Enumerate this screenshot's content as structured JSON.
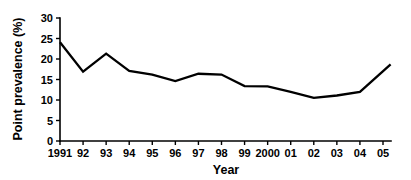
{
  "chart_data": {
    "type": "line",
    "title": "",
    "xlabel": "Year",
    "ylabel": "Point prevalence (%)",
    "categories": [
      "1991",
      "92",
      "93",
      "94",
      "95",
      "96",
      "97",
      "98",
      "99",
      "2000",
      "01",
      "02",
      "03",
      "04",
      "05"
    ],
    "x_tick_labels": [
      "1991",
      "92",
      "93",
      "94",
      "95",
      "96",
      "97",
      "98",
      "99",
      "2000",
      "01",
      "02",
      "03",
      "04",
      "05"
    ],
    "y_tick_labels": [
      "0",
      "5",
      "10",
      "15",
      "20",
      "25",
      "30"
    ],
    "y_ticks": [
      0,
      5,
      10,
      15,
      20,
      25,
      30
    ],
    "ylim": [
      0,
      30
    ],
    "grid": false,
    "legend": "none",
    "series": [
      {
        "name": "Point prevalence",
        "color": "#000000",
        "values": [
          24.1,
          16.9,
          21.3,
          17.1,
          16.2,
          14.6,
          16.4,
          16.2,
          13.4,
          13.3,
          12.0,
          10.5,
          11.1,
          12.0,
          18.7
        ]
      }
    ],
    "line_extends_past_last_tick": true,
    "end_value": 18.7
  },
  "axis": {
    "y_label": "Point prevalence (%)",
    "x_label": "Year"
  }
}
